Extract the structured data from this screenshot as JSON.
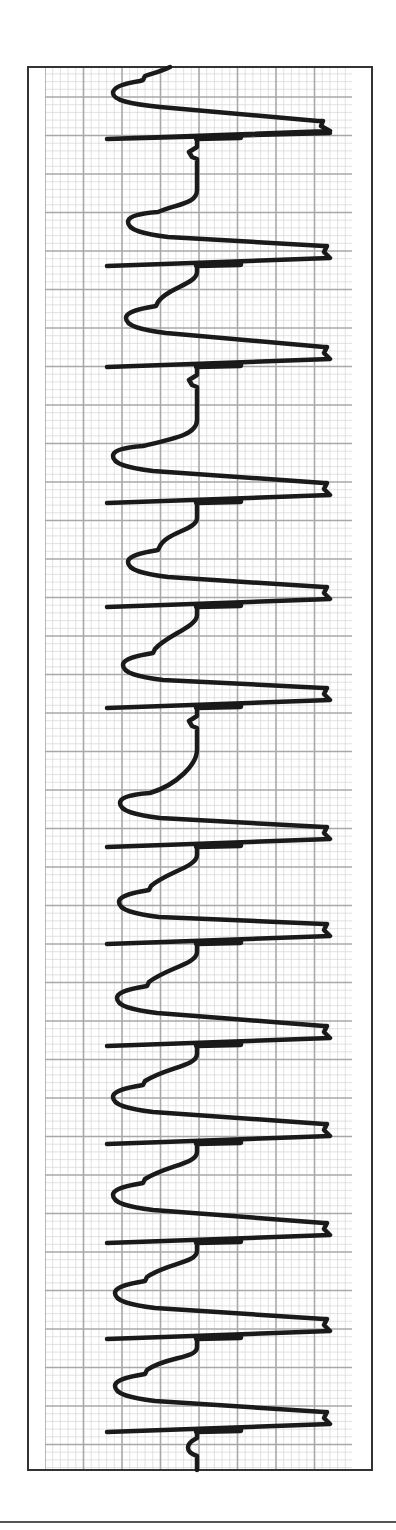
{
  "chart_data": {
    "type": "line",
    "title": "",
    "xlabel": "",
    "ylabel": "",
    "orientation": "vertical",
    "grid": true,
    "grid_major_px": 38.5,
    "grid_minor_divisions": 5,
    "colors": {
      "trace": "#1a1a1a",
      "grid_major": "#a8a8a8",
      "grid_minor": "#d6d6d6",
      "frame": "#333333",
      "background": "#ffffff"
    },
    "frame": {
      "x": 28,
      "y": 67,
      "width": 344,
      "height": 1403
    },
    "grid_area": {
      "x": 45,
      "y": 67,
      "width": 307,
      "height": 1403
    },
    "baseline_x": 197,
    "spike": {
      "left_x": 107,
      "right_x": 330,
      "thick_from_x": 197,
      "thick_to_x": 240
    },
    "pacing_spikes_y": [
      139,
      266,
      367,
      503,
      607,
      708,
      847,
      944,
      1046,
      1144,
      1243,
      1339,
      1432
    ],
    "beats": [
      {
        "start_y": 139,
        "end_y": 266,
        "trough_x": 128,
        "trough_y": 222,
        "vertical_until_y": 190
      },
      {
        "start_y": 266,
        "end_y": 367,
        "trough_x": 126,
        "trough_y": 318,
        "vertical_until_y": 272
      },
      {
        "start_y": 367,
        "end_y": 503,
        "trough_x": 113,
        "trough_y": 456,
        "vertical_until_y": 420
      },
      {
        "start_y": 503,
        "end_y": 607,
        "trough_x": 128,
        "trough_y": 562,
        "vertical_until_y": 518
      },
      {
        "start_y": 607,
        "end_y": 708,
        "trough_x": 123,
        "trough_y": 665,
        "vertical_until_y": 615
      },
      {
        "start_y": 708,
        "end_y": 847,
        "trough_x": 120,
        "trough_y": 803,
        "vertical_until_y": 750
      },
      {
        "start_y": 847,
        "end_y": 944,
        "trough_x": 119,
        "trough_y": 902,
        "vertical_until_y": 855
      },
      {
        "start_y": 944,
        "end_y": 1046,
        "trough_x": 117,
        "trough_y": 998,
        "vertical_until_y": 952
      },
      {
        "start_y": 1046,
        "end_y": 1144,
        "trough_x": 113,
        "trough_y": 1097,
        "vertical_until_y": 1054
      },
      {
        "start_y": 1144,
        "end_y": 1243,
        "trough_x": 113,
        "trough_y": 1195,
        "vertical_until_y": 1152
      },
      {
        "start_y": 1243,
        "end_y": 1339,
        "trough_x": 115,
        "trough_y": 1293,
        "vertical_until_y": 1251
      },
      {
        "start_y": 1339,
        "end_y": 1432,
        "trough_x": 115,
        "trough_y": 1386,
        "vertical_until_y": 1347
      }
    ],
    "initial_partial_beat": {
      "start_x": 170,
      "start_y": 67,
      "trough_x": 113,
      "trough_y": 93,
      "end_y": 139
    },
    "final_tail": {
      "start_y": 1432,
      "end_y": 1470
    },
    "bottom_rule_y": 1522
  }
}
